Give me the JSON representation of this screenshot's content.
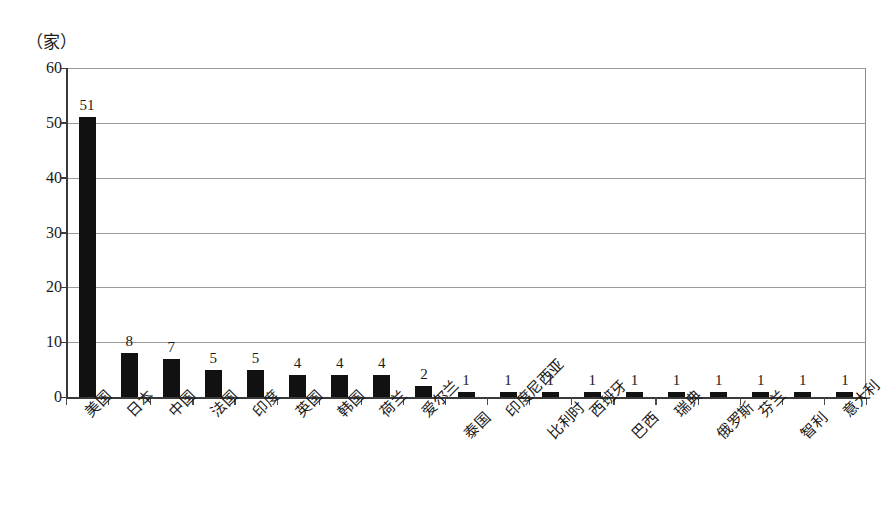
{
  "chart_data": {
    "type": "bar",
    "title": "",
    "subtitle": "",
    "xlabel": "",
    "ylabel": "（家）",
    "unit_caption": "（家）",
    "ylim": [
      0,
      60
    ],
    "ytick_labels": [
      "0",
      "10",
      "20",
      "30",
      "40",
      "50",
      "60"
    ],
    "ytick_values": [
      0,
      10,
      20,
      30,
      40,
      50,
      60
    ],
    "grid": true,
    "grid_axis": "y",
    "legend": null,
    "bar_color": "#111111",
    "categories": [
      "美国",
      "日本",
      "中国",
      "法国",
      "印度",
      "英国",
      "韩国",
      "荷兰",
      "爱尔兰",
      "泰国",
      "印度尼西亚",
      "比利时",
      "西班牙",
      "巴西",
      "瑞典",
      "俄罗斯",
      "芬兰",
      "智利",
      "意大利"
    ],
    "values": [
      51,
      8,
      7,
      5,
      5,
      4,
      4,
      4,
      2,
      1,
      1,
      1,
      1,
      1,
      1,
      1,
      1,
      1,
      1
    ],
    "value_labels": [
      "51",
      "8",
      "7",
      "5",
      "5",
      "4",
      "4",
      "4",
      "2",
      "1",
      "1",
      "1",
      "1",
      "1",
      "1",
      "1",
      "1",
      "1",
      "1"
    ]
  }
}
